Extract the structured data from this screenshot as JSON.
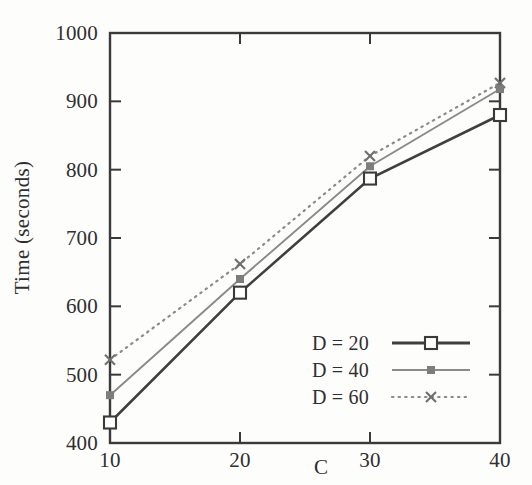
{
  "chart_data": {
    "type": "line",
    "title": "",
    "xlabel": "C",
    "ylabel": "Time (seconds)",
    "x": [
      10,
      20,
      30,
      40
    ],
    "xticklabels": [
      "10",
      "20",
      "30",
      "40"
    ],
    "yticklabels": [
      "400",
      "500",
      "600",
      "700",
      "800",
      "900",
      "1000"
    ],
    "yticks": [
      400,
      500,
      600,
      700,
      800,
      900,
      1000
    ],
    "xlim": [
      10,
      40
    ],
    "ylim": [
      400,
      1000
    ],
    "grid": false,
    "legend_position": "lower right inside",
    "series": [
      {
        "name": "D = 20",
        "values": [
          430,
          620,
          787,
          880
        ],
        "color": "#3a3a3a",
        "marker": "open-square",
        "linestyle": "solid",
        "linewidth": 2.6
      },
      {
        "name": "D = 40",
        "values": [
          470,
          640,
          805,
          918
        ],
        "color": "#8a8a8a",
        "marker": "filled-square",
        "linestyle": "solid",
        "linewidth": 1.6
      },
      {
        "name": "D = 60",
        "values": [
          522,
          662,
          820,
          927
        ],
        "color": "#8a8a8a",
        "marker": "cross",
        "linestyle": "dotted",
        "linewidth": 1.8
      }
    ]
  },
  "axes": {
    "y_tick_0": "400",
    "y_tick_1": "500",
    "y_tick_2": "600",
    "y_tick_3": "700",
    "y_tick_4": "800",
    "y_tick_5": "900",
    "y_tick_6": "1000",
    "x_tick_0": "10",
    "x_tick_1": "20",
    "x_tick_2": "30",
    "x_tick_3": "40",
    "x_axis_title": "C",
    "y_axis_title": "Time (seconds)",
    "frame_color": "#3a3a3a"
  },
  "legend": {
    "entry_0": "D = 20",
    "entry_1": "D = 40",
    "entry_2": "D = 60"
  }
}
